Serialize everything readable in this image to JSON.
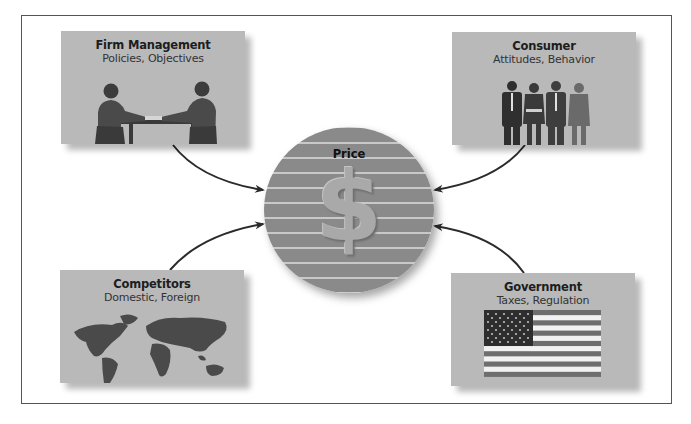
{
  "diagram": {
    "center": {
      "label": "Price",
      "symbol": "$"
    },
    "nodes": [
      {
        "id": "firm",
        "title": "Firm Management",
        "subtitle": "Policies, Objectives",
        "image": "handshake-meeting-icon"
      },
      {
        "id": "consumer",
        "title": "Consumer",
        "subtitle": "Attitudes, Behavior",
        "image": "people-group-icon"
      },
      {
        "id": "competitors",
        "title": "Competitors",
        "subtitle": "Domestic, Foreign",
        "image": "world-map-icon"
      },
      {
        "id": "government",
        "title": "Government",
        "subtitle": "Taxes, Regulation",
        "image": "us-flag-icon"
      }
    ],
    "edges": [
      {
        "from": "firm",
        "to": "center"
      },
      {
        "from": "consumer",
        "to": "center"
      },
      {
        "from": "competitors",
        "to": "center"
      },
      {
        "from": "government",
        "to": "center"
      }
    ]
  },
  "colors": {
    "card_bg": "#b9b9b9",
    "circle_fill": "#8a8a8a",
    "circle_stripe": "#c8c8c8",
    "arrow": "#2b2b2b",
    "frame_border": "#555555"
  }
}
